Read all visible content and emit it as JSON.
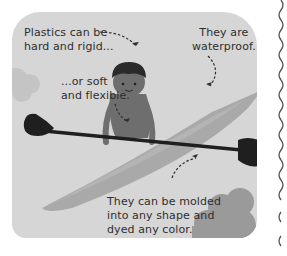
{
  "illustration": {
    "subject": "child paddling a kayak",
    "colors": {
      "panel_bg": "#d6d6d6",
      "kayak": "#a9a9a9",
      "kayak_highlight": "#bdbdbd",
      "paddle": "#1f1f1f",
      "child_skin": "#6e6e6e",
      "child_hair": "#2a2a2a",
      "cloud": "#9a9a9a",
      "cloud_light": "#c4c4c4",
      "text": "#2e2e2e"
    }
  },
  "captions": {
    "hard": "Plastics can be\nhard and rigid...",
    "soft": "...or soft\nand flexible.",
    "waterproof": "They are\nwaterproof.",
    "molded": "They can be molded\ninto any shape and\ndyed any color."
  }
}
